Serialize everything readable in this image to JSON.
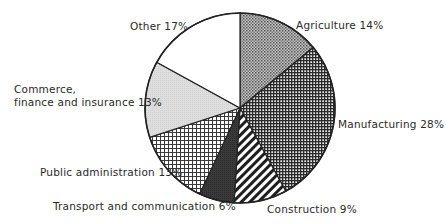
{
  "chart_data": {
    "type": "pie",
    "title": "",
    "start": "top",
    "direction": "clockwise",
    "slices": [
      {
        "label": "Agriculture",
        "value": 14,
        "text": "Agriculture 14%",
        "pattern": "fine-dots",
        "color": "#8a8a8a"
      },
      {
        "label": "Manufacturing",
        "value": 28,
        "text": "Manufacturing 28%",
        "pattern": "dense-grid",
        "color": "#3a3a3a"
      },
      {
        "label": "Construction",
        "value": 9,
        "text": "Construction 9%",
        "pattern": "diagonal-stripes",
        "color": "#222222"
      },
      {
        "label": "Transport and communication",
        "value": 6,
        "text": "Transport and communication 6%",
        "pattern": "solid-dark",
        "color": "#333333"
      },
      {
        "label": "Public administration",
        "value": 13,
        "text": "Public administration 13%",
        "pattern": "open-grid",
        "color": "#555555"
      },
      {
        "label": "Commerce, finance and insurance",
        "value": 13,
        "text_lines": [
          "Commerce,",
          "finance and insurance 13%"
        ],
        "pattern": "light-solid",
        "color": "#dcdcdc"
      },
      {
        "label": "Other",
        "value": 17,
        "text": "Other 17%",
        "pattern": "white",
        "color": "#ffffff"
      }
    ],
    "legend": "none",
    "units": "%"
  }
}
